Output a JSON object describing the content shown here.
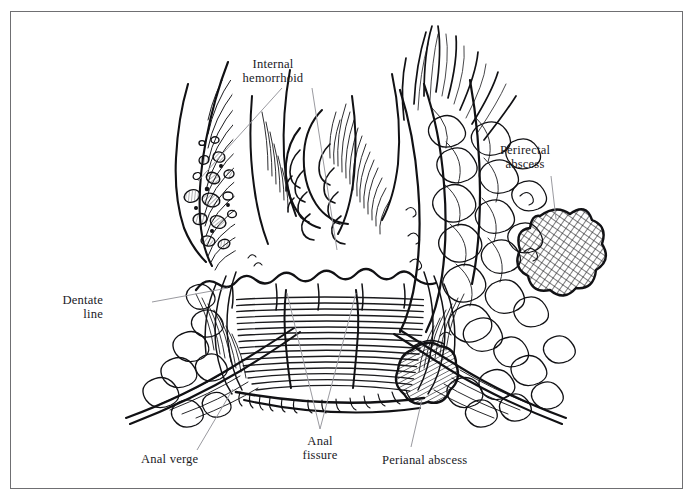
{
  "figure": {
    "kind": "anatomical-line-illustration",
    "style": "pen-and-ink hatched medical drawing, black on white",
    "border_color": "#6f6f72",
    "ink_color": "#111114",
    "background_color": "#ffffff",
    "leader_line_color": "#9a9aa0"
  },
  "labels": [
    {
      "id": "internal-hemorrhoid",
      "text": "Internal\nhemorrhoid",
      "x": 273,
      "y": 57,
      "align": "center",
      "leaders": [
        {
          "from": [
            282,
            88
          ],
          "to": [
            198,
            181
          ]
        },
        {
          "from": [
            312,
            88
          ],
          "to": [
            337,
            250
          ]
        }
      ]
    },
    {
      "id": "perirectal-abscess",
      "text": "Perirectal\nabscess",
      "x": 525,
      "y": 143,
      "align": "center",
      "leaders": [
        {
          "from": [
            551,
            176
          ],
          "to": [
            556,
            219
          ]
        }
      ]
    },
    {
      "id": "dentate-line",
      "text": "Dentate\nline",
      "x": 103,
      "y": 293,
      "align": "right",
      "leaders": [
        {
          "from": [
            152,
            302
          ],
          "to": [
            228,
            288
          ]
        }
      ]
    },
    {
      "id": "anal-verge",
      "text": "Anal verge",
      "x": 141,
      "y": 452,
      "align": "left",
      "leaders": [
        {
          "from": [
            197,
            450
          ],
          "to": [
            233,
            389
          ]
        }
      ]
    },
    {
      "id": "anal-fissure",
      "text": "Anal\nfissure",
      "x": 301,
      "y": 434,
      "align": "center",
      "leaders": [
        {
          "from": [
            320,
            429
          ],
          "to": [
            287,
            293
          ]
        },
        {
          "from": [
            320,
            429
          ],
          "to": [
            356,
            293
          ]
        }
      ]
    },
    {
      "id": "perianal-abscess",
      "text": "Perianal abscess",
      "x": 382,
      "y": 453,
      "align": "left",
      "leaders": [
        {
          "from": [
            411,
            447
          ],
          "to": [
            422,
            399
          ]
        }
      ]
    }
  ],
  "structures": [
    {
      "name": "rectal-mucosa-columns",
      "note": "bulging hemorrhoidal columns, upper centre"
    },
    {
      "name": "hemorrhoidal-venous-plexus",
      "note": "cross-sectioned vessels in left wall"
    },
    {
      "name": "dentate-line-ridge",
      "note": "scalloped junction mid-canal"
    },
    {
      "name": "anal-canal-lining",
      "note": "dense horizontal hatching"
    },
    {
      "name": "anal-fissure-tear",
      "note": "vertical split in posterior canal"
    },
    {
      "name": "internal-sphincter",
      "note": "fibre bundles flanking canal"
    },
    {
      "name": "levator-ani-fibres",
      "note": "fanning strands, upper right"
    },
    {
      "name": "ischioanal-fat",
      "note": "lobular cloud-like tissue, right"
    },
    {
      "name": "perirectal-abscess-mass",
      "note": "crosshatched blob, right margin"
    },
    {
      "name": "perianal-abscess-mass",
      "note": "crosshatched oval, lower right"
    },
    {
      "name": "perianal-skin",
      "note": "sweeping curved contour lines, bottom"
    }
  ]
}
